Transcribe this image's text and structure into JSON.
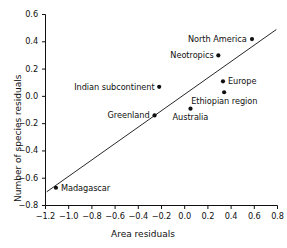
{
  "chart_data": {
    "type": "scatter",
    "title": "",
    "xlabel": "Area residuals",
    "ylabel": "Number of species residuals",
    "xlim": [
      -1.2,
      0.8
    ],
    "ylim": [
      -0.8,
      0.6
    ],
    "xticks": [
      "−1.2",
      "−1.0",
      "−0.8",
      "−0.6",
      "−0.4",
      "−0.2",
      "0.0",
      "0.2",
      "0.4",
      "0.6",
      "0.8"
    ],
    "xtick_values": [
      -1.2,
      -1.0,
      -0.8,
      -0.6,
      -0.4,
      -0.2,
      0.0,
      0.2,
      0.4,
      0.6,
      0.8
    ],
    "yticks": [
      "0.6",
      "0.4",
      "0.2",
      "0.0",
      "−0.2",
      "−0.4",
      "−0.6",
      "−0.8"
    ],
    "ytick_values": [
      0.6,
      0.4,
      0.2,
      0.0,
      -0.2,
      -0.4,
      -0.6,
      -0.8
    ],
    "grid": false,
    "legend": false,
    "points": [
      {
        "label": "North America",
        "x": 0.58,
        "y": 0.42,
        "label_pos": "left"
      },
      {
        "label": "Neotropics",
        "x": 0.29,
        "y": 0.3,
        "label_pos": "left"
      },
      {
        "label": "Europe",
        "x": 0.33,
        "y": 0.11,
        "label_pos": "right"
      },
      {
        "label": "Ethiopian region",
        "x": 0.34,
        "y": 0.03,
        "label_pos": "below"
      },
      {
        "label": "Indian subcontinent",
        "x": -0.22,
        "y": 0.07,
        "label_pos": "left"
      },
      {
        "label": "Greenland",
        "x": -0.26,
        "y": -0.14,
        "label_pos": "left"
      },
      {
        "label": "Australia",
        "x": 0.05,
        "y": -0.09,
        "label_pos": "below"
      },
      {
        "label": "Madagascar",
        "x": -1.11,
        "y": -0.67,
        "label_pos": "right"
      }
    ],
    "trendline": {
      "x0": -1.19,
      "y0": -0.7,
      "x1": 0.79,
      "y1": 0.49
    }
  },
  "axis": {
    "xlabel": "Area residuals",
    "ylabel": "Number of species residuals"
  },
  "colors": {
    "point": "#101010",
    "line": "#101010",
    "axis": "#101010",
    "text": "#101010",
    "background": "#ffffff"
  }
}
